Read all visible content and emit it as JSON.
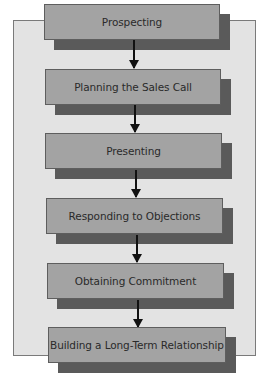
{
  "diagram": {
    "type": "flowchart",
    "direction": "top-to-bottom",
    "steps": [
      {
        "label": "Prospecting"
      },
      {
        "label": "Planning the Sales Call"
      },
      {
        "label": "Presenting"
      },
      {
        "label": "Responding to Objections"
      },
      {
        "label": "Obtaining Commitment"
      },
      {
        "label": "Building a Long-Term Relationship"
      }
    ],
    "edges": [
      {
        "from": 0,
        "to": 1
      },
      {
        "from": 1,
        "to": 2
      },
      {
        "from": 2,
        "to": 3
      },
      {
        "from": 3,
        "to": 4
      },
      {
        "from": 4,
        "to": 5
      }
    ],
    "colors": {
      "panel": "#e3e3e3",
      "box": "#a3a3a3",
      "shadow": "#5a5a5a",
      "arrow": "#111111"
    }
  }
}
